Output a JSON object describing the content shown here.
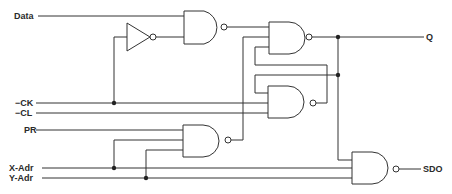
{
  "diagram": {
    "type": "logic-schematic",
    "inputs": {
      "data": "Data",
      "ck": "−CK",
      "cl": "−CL",
      "pr": "PR",
      "x_adr": "X-Adr",
      "y_adr": "Y-Adr"
    },
    "outputs": {
      "q": "Q",
      "sdo": "SDO"
    },
    "components": [
      {
        "id": "inv1",
        "kind": "inverter"
      },
      {
        "id": "nand1",
        "kind": "nand",
        "inputs": 2
      },
      {
        "id": "nand2",
        "kind": "nand",
        "inputs": 3
      },
      {
        "id": "nand3",
        "kind": "nand",
        "inputs": 3
      },
      {
        "id": "nand4",
        "kind": "nand",
        "inputs": 3
      },
      {
        "id": "nand5",
        "kind": "nand",
        "inputs": 3
      }
    ],
    "colors": {
      "line": "#333333",
      "background": "#ffffff"
    }
  }
}
